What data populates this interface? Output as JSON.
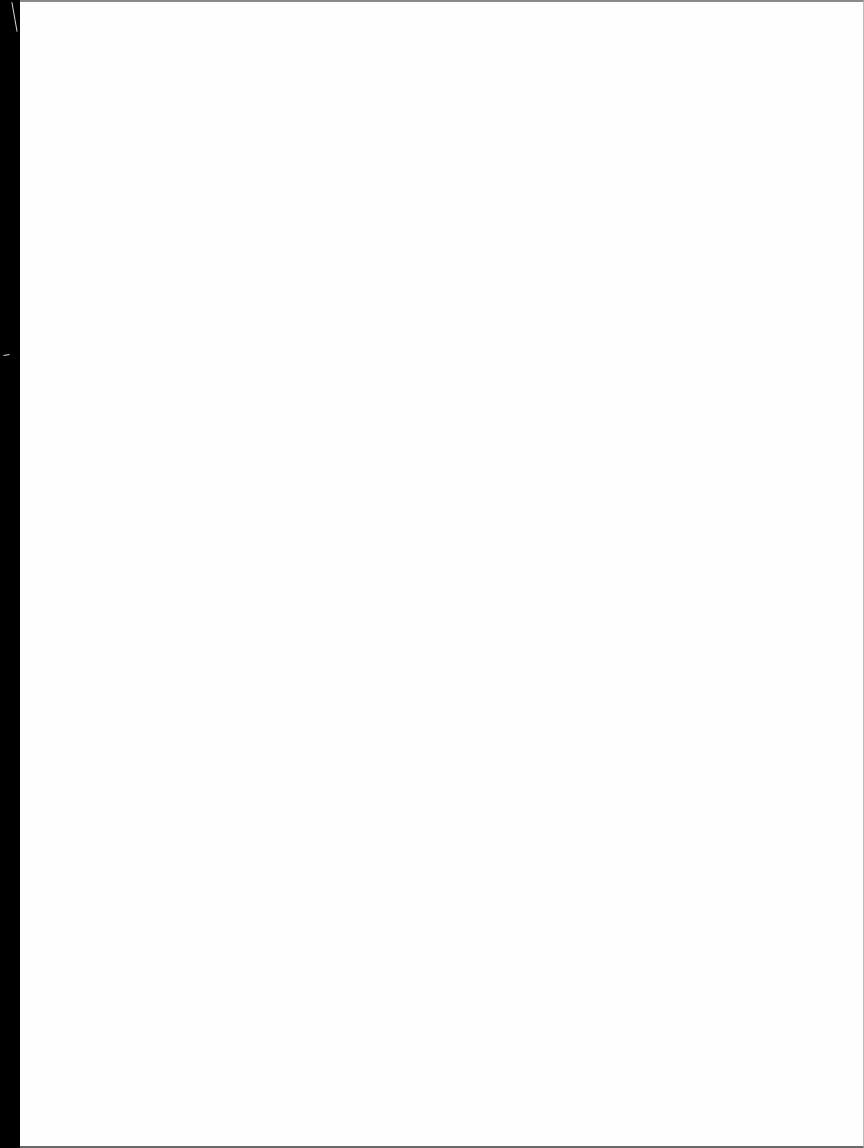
{
  "document": {
    "type": "scanned-page",
    "content": "",
    "page_color": "#fefefe",
    "edge_color": "#000000"
  }
}
